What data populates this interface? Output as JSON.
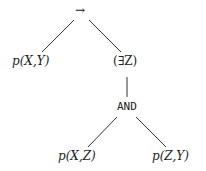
{
  "tree": {
    "root": {
      "label": "→"
    },
    "left_leaf": {
      "label": "p(X,Y)"
    },
    "exists": {
      "label": "(∃Z)"
    },
    "and": {
      "label": "AND"
    },
    "and_left": {
      "label": "p(X,Z)"
    },
    "and_right": {
      "label": "p(Z,Y)"
    }
  }
}
